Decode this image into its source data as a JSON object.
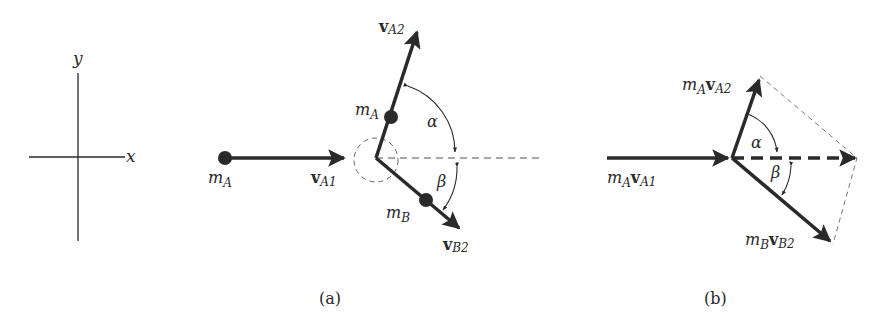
{
  "axes": {
    "x_label": "x",
    "y_label": "y"
  },
  "panel_a": {
    "caption": "(a)",
    "mass_A_initial": {
      "m": "m",
      "sub": "A"
    },
    "v_A1": {
      "v": "v",
      "sub": "A1"
    },
    "mass_A_after": {
      "m": "m",
      "sub": "A"
    },
    "v_A2": {
      "v": "v",
      "sub": "A2"
    },
    "mass_B": {
      "m": "m",
      "sub": "B"
    },
    "v_B2": {
      "v": "v",
      "sub": "B2"
    },
    "alpha": "α",
    "beta": "β"
  },
  "panel_b": {
    "caption": "(b)",
    "p_A1": {
      "m": "m",
      "msub": "A",
      "v": "v",
      "vsub": "A1"
    },
    "p_A2": {
      "m": "m",
      "msub": "A",
      "v": "v",
      "vsub": "A2"
    },
    "p_B2": {
      "m": "m",
      "msub": "B",
      "v": "v",
      "vsub": "B2"
    },
    "alpha": "α",
    "beta": "β"
  },
  "colors": {
    "ink": "#2a2a2a",
    "dashed": "#555555",
    "background": "#ffffff"
  }
}
